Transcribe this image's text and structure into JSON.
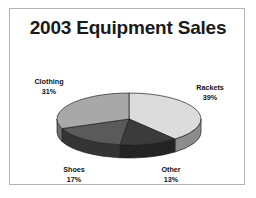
{
  "chart_data": {
    "type": "pie",
    "title": "2003 Equipment Sales",
    "xlabel": "",
    "ylabel": "",
    "three_d": true,
    "legend_position": "none",
    "grid": false,
    "categories": [
      "Rackets",
      "Other",
      "Shoes",
      "Clothing"
    ],
    "values": [
      39,
      13,
      17,
      31
    ],
    "value_unit": "%",
    "slices": [
      {
        "label": "Rackets",
        "percent": "39%",
        "value": 39,
        "color": "#dcdcdc",
        "side_color": "#8c8c8c",
        "label_position": "right"
      },
      {
        "label": "Other",
        "percent": "13%",
        "value": 13,
        "color": "#3b3b3b",
        "side_color": "#242424",
        "label_position": "bottom-right"
      },
      {
        "label": "Shoes",
        "percent": "17%",
        "value": 17,
        "color": "#5a5a5a",
        "side_color": "#343434",
        "label_position": "bottom-left"
      },
      {
        "label": "Clothing",
        "percent": "31%",
        "value": 31,
        "color": "#a8a8a8",
        "side_color": "#6e6e6e",
        "label_position": "top-left"
      }
    ],
    "border_color": "#b4b4b4",
    "background_color": "#ffffff",
    "title_color": "#1a1a1a"
  }
}
